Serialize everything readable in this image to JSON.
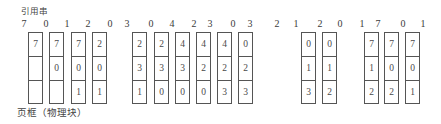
{
  "title": "引用串",
  "footer_label": "页框（物理块）",
  "reference_string": {
    "values": [
      "7",
      "0",
      "1",
      "2",
      "0",
      "3",
      "0",
      "4",
      "2",
      "3",
      "0",
      "3",
      "2",
      "1",
      "2",
      "0",
      "1",
      "7",
      "0",
      "1"
    ]
  },
  "frames": {
    "frame_count": 3,
    "columns": [
      {
        "ref_index": 0,
        "cells": [
          "7",
          "",
          ""
        ]
      },
      {
        "ref_index": 1,
        "cells": [
          "7",
          "0",
          ""
        ]
      },
      {
        "ref_index": 2,
        "cells": [
          "7",
          "0",
          "1"
        ]
      },
      {
        "ref_index": 3,
        "cells": [
          "2",
          "0",
          "1"
        ]
      },
      {
        "ref_index": 5,
        "cells": [
          "2",
          "3",
          "1"
        ]
      },
      {
        "ref_index": 6,
        "cells": [
          "2",
          "3",
          "0"
        ]
      },
      {
        "ref_index": 7,
        "cells": [
          "4",
          "3",
          "0"
        ]
      },
      {
        "ref_index": 8,
        "cells": [
          "4",
          "2",
          "0"
        ]
      },
      {
        "ref_index": 9,
        "cells": [
          "4",
          "2",
          "3"
        ]
      },
      {
        "ref_index": 10,
        "cells": [
          "0",
          "2",
          "3"
        ]
      },
      {
        "ref_index": 13,
        "cells": [
          "0",
          "1",
          "3"
        ]
      },
      {
        "ref_index": 14,
        "cells": [
          "0",
          "1",
          "2"
        ]
      },
      {
        "ref_index": 17,
        "cells": [
          "7",
          "1",
          "2"
        ]
      },
      {
        "ref_index": 18,
        "cells": [
          "7",
          "0",
          "2"
        ]
      },
      {
        "ref_index": 19,
        "cells": [
          "7",
          "0",
          "1"
        ]
      }
    ]
  },
  "colors": {
    "background": "#ffffff",
    "border": "#555555",
    "text": "#3a3a3a"
  }
}
